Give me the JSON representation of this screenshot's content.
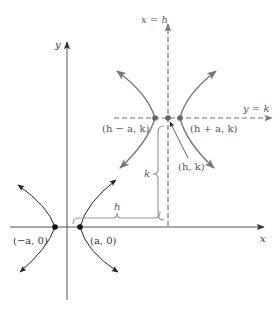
{
  "diagram": {
    "colors": {
      "axis": "#555555",
      "original_curve": "#222222",
      "translated_curve": "#777777",
      "dashed_line": "#777777",
      "brace": "#999999",
      "point_dark": "#111111",
      "point_gray": "#666666"
    },
    "axes": {
      "x_label": "x",
      "y_label": "y"
    },
    "original_hyperbola": {
      "left_vertex_label": "(−a, 0)",
      "right_vertex_label": "(a, 0)"
    },
    "translated_hyperbola": {
      "left_vertex_label": "(h − a, k)",
      "right_vertex_label": "(h + a, k)",
      "center_label": "(h, k)",
      "vertical_line_label": "x = h",
      "horizontal_line_label": "y = k"
    },
    "braces": {
      "horizontal_label": "h",
      "vertical_label": "k"
    }
  }
}
